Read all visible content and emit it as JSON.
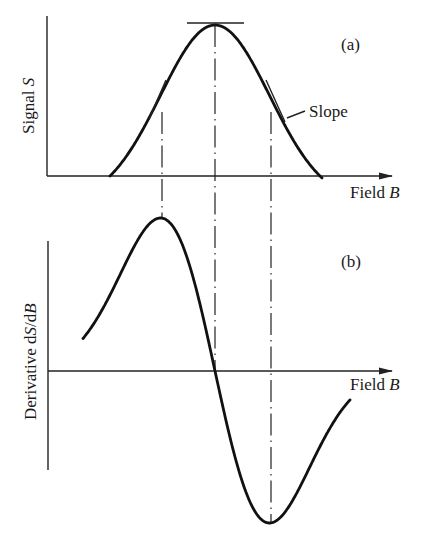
{
  "figure": {
    "panel_a": {
      "tag": "(a)",
      "y_label_prefix": "Signal ",
      "y_label_var": "S",
      "x_label_prefix": "Field ",
      "x_label_var": "B",
      "annotation": "Slope"
    },
    "panel_b": {
      "tag": "(b)",
      "y_label_prefix": "Derivative d",
      "y_label_var1": "S",
      "y_label_mid": "/d",
      "y_label_var2": "B",
      "x_label_prefix": "Field ",
      "x_label_var": "B"
    }
  },
  "geometry": {
    "peak_x": 215,
    "inflection_left_x": 162,
    "inflection_right_x": 271,
    "a": {
      "axis_x": 47,
      "axis_top": 16,
      "baseline_y": 176,
      "axis_end_x": 392,
      "peak_y": 25,
      "start_x": 110,
      "end_x": 322
    },
    "b": {
      "axis_x": 48,
      "axis_top": 241,
      "axis_bottom": 470,
      "baseline_y": 371,
      "axis_end_x": 392,
      "max_y": 218,
      "min_y": 523,
      "start_x": 83,
      "end_x": 350
    }
  },
  "colors": {
    "ink": "#111111",
    "background": "#ffffff"
  }
}
